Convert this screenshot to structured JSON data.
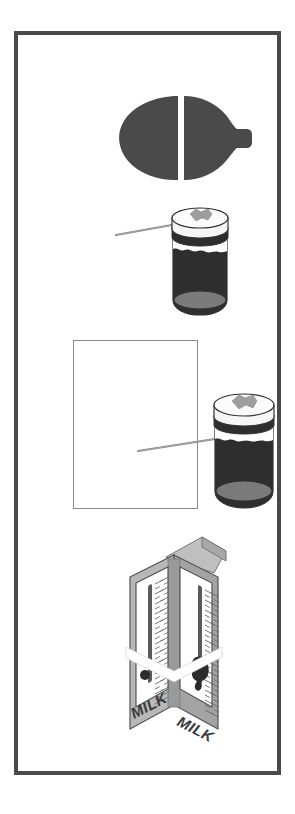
{
  "page": {
    "width": 295,
    "height": 814,
    "background_color": "#ffffff"
  },
  "frame": {
    "name": "outer-border-frame",
    "border_color": "#4a4a4a",
    "border_width_px": 4,
    "fill_color": "#ffffff",
    "left": 14,
    "top": 31,
    "width": 267,
    "height": 744
  },
  "figures": [
    {
      "id": "bottle",
      "name": "split-bottle-silhouette",
      "label": "",
      "fill_color": "#4a4a4a",
      "gap_color": "#ffffff",
      "orientation": "horizontal",
      "left": 98,
      "top": 58,
      "width": 140,
      "height": 90
    },
    {
      "id": "jar1",
      "name": "jar-with-pointer-top",
      "label": "",
      "lid_color": "#f2f2f2",
      "lid_outline": "#333333",
      "band_color": "#ffffff",
      "body_color": "#2e2e2e",
      "base_color": "#7a7a7a",
      "tag_color": "#9e9e9e",
      "pointer_color": "#8c8c8c",
      "left": 98,
      "top": 170,
      "width": 145,
      "height": 120
    },
    {
      "id": "blank_rect",
      "name": "blank-rectangle-placeholder",
      "label": "",
      "outline_color": "#8a8a8a",
      "fill_color": "#ffffff",
      "left": 55,
      "top": 305,
      "width": 125,
      "height": 169
    },
    {
      "id": "jar2",
      "name": "jar-with-pointer-bottom",
      "label": "",
      "lid_color": "#f2f2f2",
      "lid_outline": "#333333",
      "band_color": "#ffffff",
      "body_color": "#2e2e2e",
      "base_color": "#7a7a7a",
      "tag_color": "#9e9e9e",
      "pointer_color": "#8c8c8c",
      "left": 186,
      "top": 356,
      "width": 80,
      "height": 122
    },
    {
      "id": "carton",
      "name": "milk-carton-with-thermometers",
      "label": "MILK",
      "panel_color": "#ffffff",
      "side_color": "#b5b5b5",
      "side_dark_color": "#9a9a9a",
      "outline_color": "#555555",
      "mercury_color": "#5a5a5a",
      "bulb_color": "#2b2b2b",
      "left": 100,
      "top": 494,
      "width": 120,
      "height": 230
    }
  ],
  "carton": {
    "front_label": "MILK",
    "side_label": "MILK",
    "thermometer_left": {
      "name": "thermometer-left",
      "tick_count": 34,
      "bulb": "small-round"
    },
    "thermometer_right": {
      "name": "thermometer-right",
      "tick_count": 34,
      "bulb": "large-splotch"
    }
  },
  "colors": {
    "border": "#4a4a4a",
    "dark_fill": "#2e2e2e",
    "mid_gray": "#7a7a7a",
    "light_gray": "#b5b5b5",
    "outline": "#555555",
    "background": "#ffffff"
  }
}
